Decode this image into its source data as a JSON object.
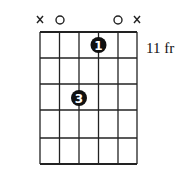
{
  "chord_diagram": {
    "fret_label": "11 fr",
    "strings": 6,
    "frets_shown": 5,
    "string_markers": [
      "x",
      "o",
      "",
      "",
      "o",
      "x"
    ],
    "fingers": [
      {
        "string": 4,
        "fret": 1,
        "finger": "1"
      },
      {
        "string": 3,
        "fret": 3,
        "finger": "3"
      }
    ],
    "colors": {
      "line": "#222222",
      "dot": "#111111",
      "dot_text": "#ffffff"
    }
  }
}
